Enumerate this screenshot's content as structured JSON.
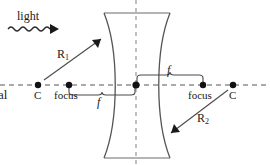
{
  "diagram": {
    "type": "optics-lens-diagram",
    "lens_kind": "biconcave diverging lens",
    "colors": {
      "stroke": "#3a3a3a",
      "axis": "#8f8f8f",
      "text": "#1a1a1a",
      "background": "#ffffff"
    }
  },
  "labels": {
    "light": "light",
    "axis_text": "al",
    "c_left": "C",
    "c_right": "C",
    "focus_left": "focus",
    "focus_right": "focus",
    "r1": "R",
    "r1_sub": "1",
    "r2": "R",
    "r2_sub": "2",
    "f_left": "f",
    "f_right": "f"
  },
  "geometry": {
    "optical_axis_y": 85,
    "lens_center_x": 136,
    "points": {
      "c_left": {
        "x": 38,
        "y": 85
      },
      "focus_left": {
        "x": 69,
        "y": 85
      },
      "lens_center": {
        "x": 136,
        "y": 85
      },
      "focus_right": {
        "x": 203,
        "y": 85
      },
      "c_right": {
        "x": 233,
        "y": 85
      }
    },
    "lens": {
      "top_y": 13,
      "bottom_y": 158,
      "top_left_x": 104,
      "top_right_x": 170,
      "bottom_left_x": 104,
      "bottom_right_x": 170,
      "waist_left_x": 118,
      "waist_right_x": 156
    },
    "r1_arrow": {
      "from_x": 46,
      "from_y": 78,
      "to_x": 105,
      "to_y": 36
    },
    "r2_arrow": {
      "from_x": 226,
      "from_y": 92,
      "to_x": 167,
      "to_y": 136
    },
    "light_wave": {
      "x_start": 8,
      "x_end": 55,
      "y": 29
    }
  },
  "icons": {
    "wave_arrow": "wave-arrow-icon",
    "r1_arrow": "radius-arrow-icon",
    "r2_arrow": "radius-arrow-icon",
    "bracket_left": "focal-length-bracket-icon",
    "bracket_right": "focal-length-bracket-icon"
  }
}
